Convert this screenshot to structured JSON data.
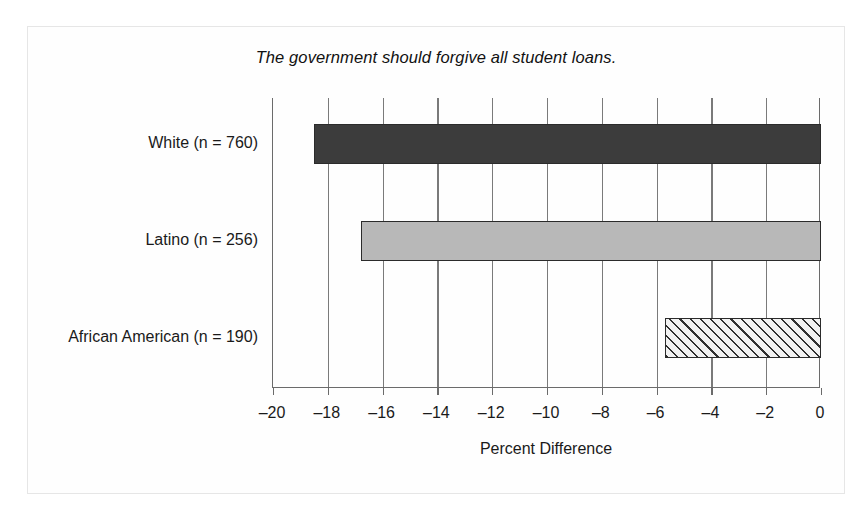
{
  "figure": {
    "title": "The government should forgive all student loans.",
    "x_axis_label": "Percent Difference"
  },
  "chart_data": {
    "type": "bar",
    "orientation": "horizontal",
    "title": "The government should forgive all student loans.",
    "xlabel": "Percent Difference",
    "ylabel": "",
    "xlim": [
      -20,
      0
    ],
    "grid": true,
    "legend": "none",
    "categories": [
      "White (n = 760)",
      "Latino (n = 256)",
      "African American (n = 190)"
    ],
    "values": [
      -18.5,
      -16.8,
      -5.7
    ],
    "bar_styles": [
      "solid-dark",
      "solid-light",
      "hatched"
    ],
    "bar_colors": [
      "#3c3c3c",
      "#b8b8b8",
      "#f2f2f2"
    ],
    "tick_values": [
      -20,
      -18,
      -16,
      -14,
      -12,
      -10,
      -8,
      -6,
      -4,
      -2,
      0
    ],
    "tick_labels": [
      "–20",
      "–18",
      "–16",
      "–14",
      "–12",
      "–10",
      "–8",
      "–6",
      "–4",
      "–2",
      "0"
    ],
    "series_name": "Percent Difference"
  }
}
